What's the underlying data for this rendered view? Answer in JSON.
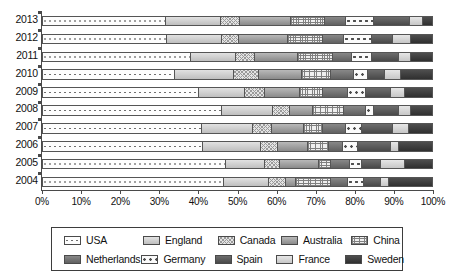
{
  "chart_data": {
    "type": "bar",
    "orientation": "horizontal",
    "stacked": true,
    "normalized": true,
    "title": "",
    "subtitle": "",
    "xlabel": "",
    "ylabel": "",
    "xlim": [
      0,
      100
    ],
    "grid": false,
    "legend_position": "bottom",
    "categories": [
      "2013",
      "2012",
      "2011",
      "2010",
      "2009",
      "2008",
      "2007",
      "2006",
      "2005",
      "2004"
    ],
    "category_order_top_to_bottom": [
      "2013",
      "2012",
      "2011",
      "2010",
      "2009",
      "2008",
      "2007",
      "2006",
      "2005",
      "2004"
    ],
    "xticks": [
      0,
      10,
      20,
      30,
      40,
      50,
      60,
      70,
      80,
      90,
      100
    ],
    "xticklabels": [
      "0%",
      "10%",
      "20%",
      "30%",
      "40%",
      "50%",
      "60%",
      "70%",
      "80%",
      "90%",
      "100%"
    ],
    "series": [
      {
        "name": "USA",
        "pattern": "dotted-light",
        "color": "#fdfdfd",
        "values": [
          31.5,
          32.0,
          38.0,
          34.0,
          40.0,
          46.0,
          41.0,
          41.2,
          47.0,
          46.5
        ]
      },
      {
        "name": "England",
        "pattern": "solid-lightgray",
        "color": "#c9c9c9",
        "values": [
          14.3,
          14.0,
          11.5,
          15.0,
          12.0,
          13.0,
          13.0,
          14.8,
          10.0,
          11.5
        ]
      },
      {
        "name": "Canada",
        "pattern": "crosshatch-fine",
        "color": "#e3e3e3",
        "values": [
          4.8,
          4.5,
          5.0,
          6.5,
          5.0,
          4.5,
          5.0,
          4.5,
          4.0,
          4.5
        ]
      },
      {
        "name": "Australia",
        "pattern": "solid-midgray",
        "color": "#9a9a9a",
        "values": [
          13.1,
          12.5,
          11.0,
          11.0,
          9.0,
          6.0,
          8.0,
          7.5,
          10.0,
          2.5
        ]
      },
      {
        "name": "China",
        "pattern": "grid-dense",
        "color": "#efefef",
        "values": [
          8.7,
          9.0,
          9.0,
          7.5,
          6.0,
          8.0,
          5.0,
          5.5,
          3.0,
          9.0
        ]
      },
      {
        "name": "Netherlands",
        "pattern": "solid-darkgray",
        "color": "#6e6e6e",
        "values": [
          5.6,
          5.5,
          5.0,
          6.0,
          6.5,
          5.5,
          6.0,
          3.5,
          5.0,
          4.5
        ]
      },
      {
        "name": "Germany",
        "pattern": "dotted-large",
        "color": "#fbfbfb",
        "values": [
          7.2,
          7.0,
          5.0,
          3.5,
          4.5,
          2.0,
          4.0,
          4.0,
          3.0,
          4.0
        ]
      },
      {
        "name": "Spain",
        "pattern": "solid-charcoal",
        "color": "#555555",
        "values": [
          9.2,
          5.5,
          7.0,
          4.5,
          6.5,
          6.5,
          8.0,
          8.5,
          5.0,
          4.5
        ]
      },
      {
        "name": "France",
        "pattern": "solid-palegray",
        "color": "#d6d6d6",
        "values": [
          3.3,
          4.5,
          3.0,
          4.0,
          3.5,
          3.0,
          4.0,
          2.0,
          6.0,
          2.0
        ]
      },
      {
        "name": "Sweden",
        "pattern": "solid-black",
        "color": "#3a3a3a",
        "values": [
          2.3,
          5.5,
          5.5,
          8.0,
          7.0,
          5.5,
          6.0,
          8.5,
          7.0,
          11.0
        ]
      }
    ]
  },
  "legend": {
    "row1": [
      {
        "label": "USA",
        "swatch": "p-usa"
      },
      {
        "label": "England",
        "swatch": "p-england"
      },
      {
        "label": "Canada",
        "swatch": "p-canada"
      },
      {
        "label": "Australia",
        "swatch": "p-australia"
      },
      {
        "label": "China",
        "swatch": "p-china"
      }
    ],
    "row2": [
      {
        "label": "Netherlands",
        "swatch": "p-netherlands"
      },
      {
        "label": "Germany",
        "swatch": "p-germany"
      },
      {
        "label": "Spain",
        "swatch": "p-spain"
      },
      {
        "label": "France",
        "swatch": "p-france"
      },
      {
        "label": "Sweden",
        "swatch": "p-sweden"
      }
    ]
  }
}
